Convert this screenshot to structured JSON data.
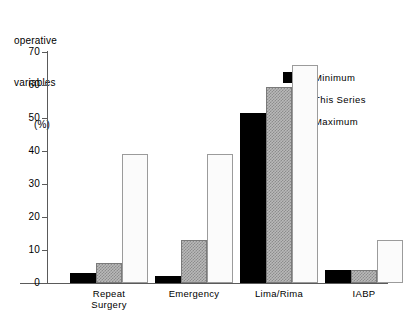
{
  "chart_data": {
    "type": "bar",
    "title": "",
    "ylabel": "operative variables (%)",
    "ylabel_lines": [
      "operative",
      "variables",
      "(%)"
    ],
    "xlabel": "",
    "categories": [
      "Repeat Surgery",
      "Emergency",
      "Lima/Rima",
      "IABP"
    ],
    "category_lines": [
      [
        "Repeat",
        "Surgery"
      ],
      [
        "Emergency"
      ],
      [
        "Lima/Rima"
      ],
      [
        "IABP"
      ]
    ],
    "series": [
      {
        "name": "Minimum",
        "values": [
          3,
          2,
          51.5,
          4
        ],
        "color": "#000000"
      },
      {
        "name": "This Series",
        "values": [
          6,
          13,
          59.5,
          4
        ],
        "color": "#b9b9b9"
      },
      {
        "name": "Maximum",
        "values": [
          39,
          39,
          66,
          13
        ],
        "color": "#fbfbfb"
      }
    ],
    "ylim": [
      0,
      70
    ],
    "ytick_values": [
      0,
      10,
      20,
      30,
      40,
      50,
      60,
      70
    ],
    "ytick_labels": [
      "0",
      "10",
      "20",
      "30",
      "40",
      "50",
      "60",
      "70"
    ],
    "grid": false,
    "legend_position": "upper right",
    "axis_color": "#5a5a5a",
    "background": "#ffffff"
  }
}
